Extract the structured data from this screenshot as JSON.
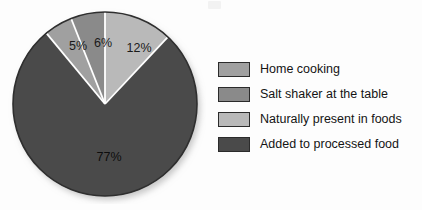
{
  "chart_data": {
    "type": "pie",
    "title": "",
    "subtitle": "",
    "xlabel": "",
    "ylabel": "",
    "legend_position": "right",
    "grid": false,
    "units": "percent",
    "start_angle_deg": 0,
    "direction": "clockwise",
    "categories": [
      "Naturally present in foods",
      "Added to processed food",
      "Home cooking",
      "Salt shaker at the table"
    ],
    "values": [
      12,
      77,
      5,
      6
    ],
    "data_labels": [
      "12%",
      "77%",
      "5%",
      "6%"
    ],
    "colors": [
      "#b9b9b9",
      "#4a4a4a",
      "#a0a0a0",
      "#8a8a8a"
    ],
    "slices": [
      {
        "label": "Naturally present in foods",
        "value": 12,
        "data_label": "12%",
        "color": "#b9b9b9",
        "label_x": 131,
        "label_y": 46,
        "label_tone": "on-light"
      },
      {
        "label": "Added to processed food",
        "value": 77,
        "data_label": "77%",
        "color": "#4a4a4a",
        "label_x": 101,
        "label_y": 155,
        "label_tone": "on-dark"
      },
      {
        "label": "Home cooking",
        "value": 5,
        "data_label": "5%",
        "color": "#a0a0a0",
        "label_x": 70,
        "label_y": 44,
        "label_tone": "on-light"
      },
      {
        "label": "Salt shaker at the table",
        "value": 6,
        "data_label": "6%",
        "color": "#8a8a8a",
        "label_x": 95,
        "label_y": 41,
        "label_tone": "on-light"
      }
    ]
  },
  "legend": {
    "items": [
      {
        "label": "Home cooking",
        "color": "#a0a0a0"
      },
      {
        "label": "Salt shaker at the table",
        "color": "#8a8a8a"
      },
      {
        "label": "Naturally present in foods",
        "color": "#b9b9b9"
      },
      {
        "label": "Added to processed food",
        "color": "#4a4a4a"
      }
    ]
  },
  "pie_geometry": {
    "center_x": 97,
    "center_y": 98,
    "radius": 92,
    "separator_color": "#ffffff",
    "separator_width": 1.8,
    "outline_color": "#2f2f2f"
  }
}
